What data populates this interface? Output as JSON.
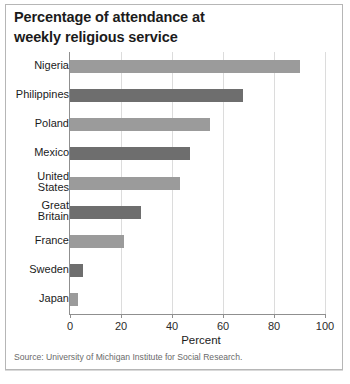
{
  "title": {
    "line1": "Percentage of attendance at",
    "line2": "weekly religious service"
  },
  "source": "Source: University of Michigan Institute for Social Research.",
  "colors": {
    "bar_light": "#9b9b9b",
    "bar_dark": "#6e6e6e",
    "axis": "#8f8f8f",
    "grid": "#dcdcdc",
    "text": "#1b1b1b",
    "frame": "#b6b6b6"
  },
  "chart_data": {
    "type": "bar",
    "orientation": "horizontal",
    "title": "Percentage of attendance at weekly religious service",
    "xlabel": "Percent",
    "ylabel": "",
    "xlim": [
      0,
      100
    ],
    "xticks": [
      0,
      20,
      40,
      60,
      80,
      100
    ],
    "xticklabels": [
      "0",
      "20",
      "40",
      "60",
      "80",
      "100"
    ],
    "grid": true,
    "legend": "none",
    "categories": [
      "Nigeria",
      "Philippines",
      "Poland",
      "Mexico",
      "United States",
      "Great Britain",
      "France",
      "Sweden",
      "Japan"
    ],
    "category_labels": [
      "Nigeria",
      "Philippines",
      "Poland",
      "Mexico",
      "United\nStates",
      "Great\nBritain",
      "France",
      "Sweden",
      "Japan"
    ],
    "values": [
      90,
      68,
      55,
      47,
      43,
      28,
      21,
      5,
      3
    ],
    "bar_colors": [
      "#9b9b9b",
      "#6e6e6e",
      "#9b9b9b",
      "#6e6e6e",
      "#9b9b9b",
      "#6e6e6e",
      "#9b9b9b",
      "#6e6e6e",
      "#9b9b9b"
    ]
  }
}
